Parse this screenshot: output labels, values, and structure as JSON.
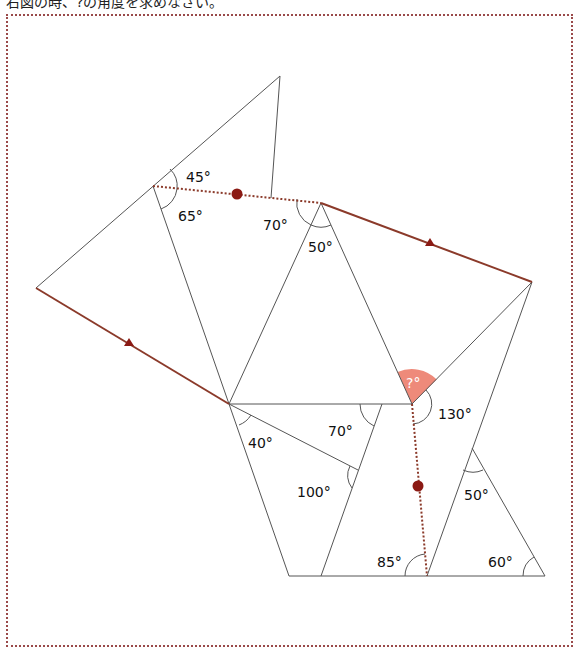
{
  "question": {
    "text": "右図の時、?の角度を求めなさい。"
  },
  "figure": {
    "line_color": "#555555",
    "path_color": "#8b3a2a",
    "marker_color": "#8b1a14",
    "highlight_color": "#ee8a7a",
    "angles": {
      "a45": "45°",
      "a65": "65°",
      "a70_top": "70°",
      "a50_top": "50°",
      "unknown": "?°",
      "a130": "130°",
      "a40": "40°",
      "a70_mid": "70°",
      "a100": "100°",
      "a85": "85°",
      "a50_bottom": "50°",
      "a60": "60°"
    }
  }
}
